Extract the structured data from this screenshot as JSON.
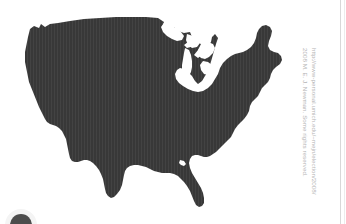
{
  "page": {
    "background_color": "#ffffff",
    "width": 346,
    "height": 224
  },
  "map": {
    "title": "United States map silhouette",
    "region": "Contiguous United States",
    "fill_color": "#383838",
    "outline_color": "#383838",
    "features": [
      "Great Lakes",
      "Michigan Upper Peninsula",
      "Michigan Lower Peninsula",
      "Florida peninsula",
      "Texas Gulf coast",
      "Maine",
      "Cape Cod",
      "Long Island",
      "California coast",
      "Chesapeake Bay"
    ]
  },
  "attribution": {
    "url_line": "http://www-personal.umich.edu/~mejn/election/2008/",
    "copyright_line": "2008 M. E. J. Newman. Some rights reserved.",
    "text_color": "#b4b4b4",
    "orientation": "vertical"
  },
  "decorations": {
    "right_rule_color": "#d8d8d8",
    "corner_mark_color": "#3a3a3a"
  }
}
